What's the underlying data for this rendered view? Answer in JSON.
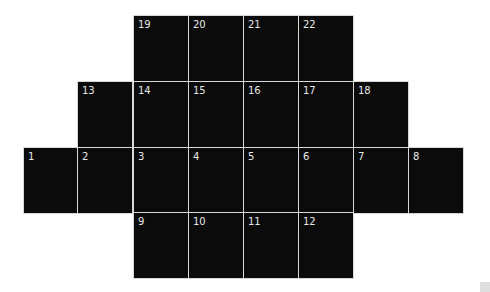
{
  "diagram": {
    "type": "numbered-cell-grid",
    "cell_color": "#0b0b0b",
    "border_color": "#d8d8d8",
    "label_color": "#e8e8e8",
    "rows": [
      {
        "row": 1,
        "cells": [
          {
            "label": "19",
            "col": 3
          },
          {
            "label": "20",
            "col": 4
          },
          {
            "label": "21",
            "col": 5
          },
          {
            "label": "22",
            "col": 6
          }
        ]
      },
      {
        "row": 2,
        "cells": [
          {
            "label": "13",
            "col": 2
          },
          {
            "label": "14",
            "col": 3
          },
          {
            "label": "15",
            "col": 4
          },
          {
            "label": "16",
            "col": 5
          },
          {
            "label": "17",
            "col": 6
          },
          {
            "label": "18",
            "col": 7
          }
        ]
      },
      {
        "row": 3,
        "cells": [
          {
            "label": "1",
            "col": 1
          },
          {
            "label": "2",
            "col": 2
          },
          {
            "label": "3",
            "col": 3
          },
          {
            "label": "4",
            "col": 4
          },
          {
            "label": "5",
            "col": 5
          },
          {
            "label": "6",
            "col": 6
          },
          {
            "label": "7",
            "col": 7
          },
          {
            "label": "8",
            "col": 8
          }
        ]
      },
      {
        "row": 4,
        "cells": [
          {
            "label": "9",
            "col": 3
          },
          {
            "label": "10",
            "col": 4
          },
          {
            "label": "11",
            "col": 5
          },
          {
            "label": "12",
            "col": 6
          }
        ]
      }
    ]
  }
}
